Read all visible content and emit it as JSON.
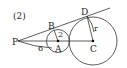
{
  "problem_number": "(2)",
  "points": {
    "P": "P",
    "A": "A",
    "B": "B",
    "C": "C",
    "D": "D"
  },
  "measures": {
    "radius_small": "2",
    "PB_arc": "6",
    "radius_large": "r"
  },
  "colors": {
    "stroke": "#333333",
    "text": "#222222",
    "background": "#ffffff"
  }
}
